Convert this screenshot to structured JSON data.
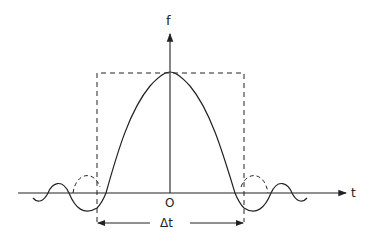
{
  "diagram": {
    "type": "sinc-pulse-with-rectangular-window",
    "labels": {
      "y_axis": "f",
      "x_axis": "t",
      "origin": "O",
      "width": "Δt"
    },
    "elements": [
      "vertical f axis with arrow",
      "horizontal t axis with arrow",
      "dashed rectangular window of width Δt",
      "solid sinc-like curve peaking at origin",
      "dashed arcs showing rectangular window side lobes",
      "double-headed dimension arrow labeled Δt"
    ],
    "colors": {
      "line": "#222222",
      "background": "#ffffff"
    }
  }
}
